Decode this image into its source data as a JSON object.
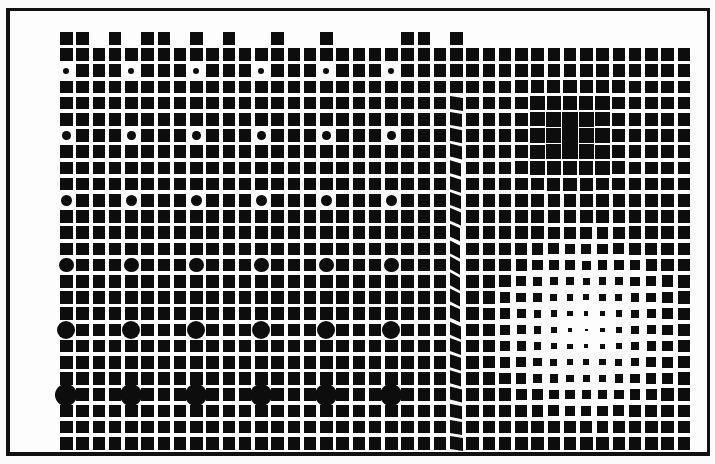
{
  "artwork": {
    "title": "",
    "style": "op-art grid of black squares with optical distortions",
    "colors": {
      "ink": "#0d0d0d",
      "paper": "#fdfdfd",
      "frame": "#111111"
    },
    "grid": {
      "origin_x": 60,
      "origin_y": 32,
      "pitch_x": 16.25,
      "pitch_y": 16.2,
      "cell_size": 12.5,
      "columns": 39,
      "rows": 26
    },
    "top_row_present_columns": [
      0,
      1,
      3,
      5,
      6,
      8,
      10,
      13,
      16,
      21,
      22,
      24
    ],
    "circle_rows": [
      {
        "row": 2,
        "diameter": 6
      },
      {
        "row": 6,
        "diameter": 8.5
      },
      {
        "row": 10,
        "diameter": 11
      },
      {
        "row": 14,
        "diameter": 14.5
      },
      {
        "row": 18,
        "diameter": 18
      },
      {
        "row": 22,
        "diameter": 22
      }
    ],
    "circle_columns": [
      0,
      4,
      8,
      12,
      16,
      20
    ],
    "skew_column": 24,
    "skew_rows_range": [
      4,
      25
    ],
    "dark_center": {
      "col": 31,
      "row": 6,
      "radius": 4.5
    },
    "light_center": {
      "col": 32,
      "row": 18,
      "radius": 6.5,
      "min_size": 2.5
    }
  }
}
